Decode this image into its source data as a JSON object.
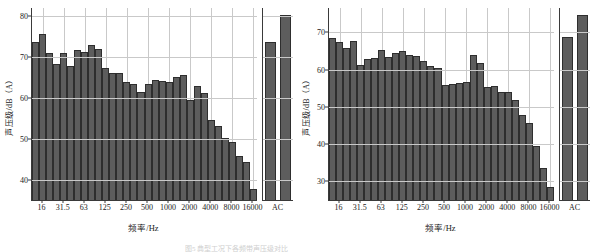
{
  "figure": {
    "caption_fragment": "图5  典型工况下各频带声压级对比"
  },
  "panels": [
    {
      "id": "left",
      "ylabel": "声压级/dB（A）",
      "xlabel": "频率/Hz",
      "ac_tick": "AC",
      "yticks": [
        40,
        50,
        60,
        70,
        80
      ],
      "ylim": [
        35.0,
        82.0
      ],
      "xticks": [
        "16",
        "31.5",
        "63",
        "125",
        "250",
        "500",
        "1000",
        "2000",
        "4000",
        "8000",
        "16000"
      ],
      "chart_data": {
        "type": "bar",
        "title": "",
        "xlabel": "频率/Hz",
        "ylabel": "声压级/dB（A）",
        "ylim": [
          35.0,
          82.0
        ],
        "grid": true,
        "legend": "none",
        "categories": [
          "12.5",
          "16",
          "20",
          "25",
          "31.5",
          "40",
          "50",
          "63",
          "80",
          "100",
          "125",
          "160",
          "200",
          "250",
          "315",
          "400",
          "500",
          "630",
          "800",
          "1000",
          "1250",
          "1600",
          "2000",
          "2500",
          "3150",
          "4000",
          "5000",
          "6300",
          "8000",
          "10000",
          "12500",
          "16000"
        ],
        "values": [
          73.6,
          75.6,
          71.0,
          68.2,
          70.9,
          67.8,
          71.8,
          71.2,
          72.9,
          71.9,
          67.3,
          66.2,
          66.1,
          63.9,
          63.4,
          61.5,
          63.4,
          64.4,
          64.2,
          64.0,
          65.1,
          65.6,
          59.6,
          62.9,
          61.2,
          54.7,
          53.2,
          50.1,
          49.1,
          45.7,
          44.2,
          37.7
        ],
        "ac_categories": [
          "A",
          "C"
        ],
        "ac_values": [
          73.8,
          80.4
        ]
      }
    },
    {
      "id": "right",
      "ylabel": "声压级/dB（A）",
      "xlabel": "频率/Hz",
      "ac_tick": "AC",
      "yticks": [
        30,
        40,
        50,
        60,
        70
      ],
      "ylim": [
        25.0,
        76.5
      ],
      "xticks": [
        "16",
        "31.5",
        "63",
        "125",
        "250",
        "500",
        "1000",
        "2000",
        "4000",
        "8000",
        "16000"
      ],
      "chart_data": {
        "type": "bar",
        "title": "",
        "xlabel": "频率/Hz",
        "ylabel": "声压级/dB（A）",
        "ylim": [
          25.0,
          76.5
        ],
        "grid": true,
        "legend": "none",
        "categories": [
          "12.5",
          "16",
          "20",
          "25",
          "31.5",
          "40",
          "50",
          "63",
          "80",
          "100",
          "125",
          "160",
          "200",
          "250",
          "315",
          "400",
          "500",
          "630",
          "800",
          "1000",
          "1250",
          "1600",
          "2000",
          "2500",
          "3150",
          "4000",
          "5000",
          "6300",
          "8000",
          "10000",
          "12500",
          "16000"
        ],
        "values": [
          68.4,
          67.4,
          65.8,
          67.7,
          61.3,
          62.9,
          63.2,
          65.3,
          63.3,
          64.3,
          64.9,
          63.8,
          63.6,
          62.4,
          61.0,
          60.3,
          55.9,
          56.1,
          56.5,
          56.7,
          63.8,
          61.8,
          55.2,
          55.5,
          54.0,
          54.1,
          51.7,
          47.7,
          45.6,
          39.4,
          33.7,
          28.4
        ],
        "ac_categories": [
          "A",
          "C"
        ],
        "ac_values": [
          68.8,
          74.5
        ]
      }
    }
  ]
}
